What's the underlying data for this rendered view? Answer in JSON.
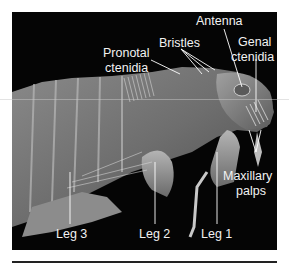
{
  "figure": {
    "background_color": "#050505",
    "label_color": "#f2f2f2",
    "labels": {
      "antenna": "Antenna",
      "bristles": "Bristles",
      "genal_ctenidia_1": "Genal",
      "genal_ctenidia_2": "ctenidia",
      "pronotal_ctenidia_1": "Pronotal",
      "pronotal_ctenidia_2": "ctenidia",
      "maxillary_palps_1": "Maxillary",
      "maxillary_palps_2": "palps",
      "leg3": "Leg 3",
      "leg2": "Leg 2",
      "leg1": "Leg 1"
    }
  }
}
